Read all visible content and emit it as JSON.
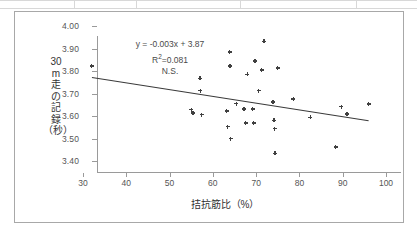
{
  "chart_data": {
    "type": "scatter",
    "title": "",
    "xlabel": "拮抗筋比（%）",
    "ylabel_lines": [
      "30",
      "m",
      "走",
      "の",
      "記",
      "録",
      "（秒）"
    ],
    "xlim": [
      30,
      100
    ],
    "ylim": [
      3.4,
      4.0
    ],
    "xticks": [
      "30",
      "40",
      "50",
      "60",
      "70",
      "80",
      "90",
      "100"
    ],
    "yticks": [
      "4.00",
      "3.90",
      "3.80",
      "3.70",
      "3.60",
      "3.50",
      "3.40"
    ],
    "grid": false,
    "legend": "none",
    "marker": "diamond",
    "marker_color": "#404040",
    "annotations": {
      "equation": "y = -0.003x + 3.87",
      "r_squared_prefix": "R",
      "r_squared_sup": "2",
      "r_squared_value": "=0.081",
      "significance": "N.S."
    },
    "trendline": {
      "slope": -0.003,
      "intercept": 3.87,
      "x_start": 32,
      "x_end": 96,
      "y_start": 3.774,
      "y_end": 3.582,
      "color": "#3a3a3a"
    },
    "points": [
      {
        "x": 32.0,
        "y": 3.822
      },
      {
        "x": 55.0,
        "y": 3.628
      },
      {
        "x": 55.4,
        "y": 3.613
      },
      {
        "x": 57.0,
        "y": 3.767
      },
      {
        "x": 57.1,
        "y": 3.713
      },
      {
        "x": 57.4,
        "y": 3.606
      },
      {
        "x": 63.2,
        "y": 3.622
      },
      {
        "x": 63.4,
        "y": 3.553
      },
      {
        "x": 63.9,
        "y": 3.885
      },
      {
        "x": 64.0,
        "y": 3.822
      },
      {
        "x": 64.1,
        "y": 3.5
      },
      {
        "x": 65.4,
        "y": 3.655
      },
      {
        "x": 67.2,
        "y": 3.631
      },
      {
        "x": 67.6,
        "y": 3.568
      },
      {
        "x": 68.0,
        "y": 3.785
      },
      {
        "x": 69.2,
        "y": 3.631
      },
      {
        "x": 69.4,
        "y": 3.568
      },
      {
        "x": 69.7,
        "y": 3.845
      },
      {
        "x": 70.6,
        "y": 3.713
      },
      {
        "x": 71.3,
        "y": 3.805
      },
      {
        "x": 71.8,
        "y": 3.932
      },
      {
        "x": 73.9,
        "y": 3.662
      },
      {
        "x": 74.1,
        "y": 3.581
      },
      {
        "x": 74.3,
        "y": 3.544
      },
      {
        "x": 74.4,
        "y": 3.434
      },
      {
        "x": 75.0,
        "y": 3.813
      },
      {
        "x": 78.6,
        "y": 3.675
      },
      {
        "x": 82.5,
        "y": 3.594
      },
      {
        "x": 88.4,
        "y": 3.462
      },
      {
        "x": 89.7,
        "y": 3.641
      },
      {
        "x": 91.0,
        "y": 3.609
      },
      {
        "x": 96.0,
        "y": 3.654
      }
    ]
  }
}
